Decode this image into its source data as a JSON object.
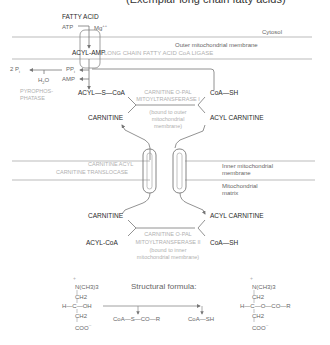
{
  "title": "(Exemplar long chain fatty acids)",
  "compartments": {
    "cytosol": "Cytosol",
    "outer_membrane": "Outer mitochondrial membrane",
    "inner_membrane_line1": "Inner mitochondrial",
    "inner_membrane_line2": "membrane",
    "matrix_line1": "Mitochondrial",
    "matrix_line2": "matrix"
  },
  "activation": {
    "fatty_acid": "FATTY ACID",
    "atp": "ATP",
    "mg": "Mg",
    "mg_charge": "++",
    "acyl_amp": "ACYL-AMP",
    "ligase": "LONG CHAIN FATTY ACID CoA LIGASE",
    "ppi": "PP",
    "ppi_sub": "i",
    "amp": "AMP",
    "two_pi": "2 P",
    "two_pi_sub": "i",
    "water": "H",
    "water_sub": "2",
    "water_o": "O",
    "pyrophosphatase_line1": "PYROPHOS-",
    "pyrophosphatase_line2": "PHATASE"
  },
  "outer_transfer": {
    "acyl_s_coa": "ACYL—S—CoA",
    "coa_sh": "CoA—SH",
    "enzyme_line1": "CARNITINE O-PAL",
    "enzyme_line2": "MITOYLTRANSFERASE I",
    "location_line1": "(bound to outer",
    "location_line2": "mitochondrial",
    "location_line3": "membrane)",
    "carnitine": "CARNITINE",
    "acyl_carnitine": "ACYL CARNITINE"
  },
  "translocase": {
    "line1": "CARNITINE ACYL",
    "line2": "CARNITINE TRANSLOCASE"
  },
  "inner_transfer": {
    "carnitine": "CARNITINE",
    "acyl_carnitine": "ACYL CARNITINE",
    "acyl_coa": "ACYL-CoA",
    "coa_sh": "CoA—SH",
    "enzyme_line1": "CARNITINE O-PAL",
    "enzyme_line2": "MITOYLTRANSFERASE II",
    "location_line1": "(bound to inner",
    "location_line2": "mitochondrial membrane)"
  },
  "structural_formula": {
    "label": "Structural formula:",
    "carnitine": {
      "charge_top": "+",
      "row1": "N(CH3)3",
      "row2": "CH2",
      "row3": "H—C—OH",
      "row4": "CH2",
      "row5": "COO",
      "charge_bottom": "−"
    },
    "reactant": "CoA—S—CO—R",
    "product_coa": "CoA—SH",
    "acyl_carnitine": {
      "charge_top": "+",
      "row1": "N(CH3)3",
      "row2": "CH2",
      "row3": "H—C—O—CO—R",
      "row4": "CH2",
      "row5": "COO",
      "charge_bottom": "−"
    }
  }
}
